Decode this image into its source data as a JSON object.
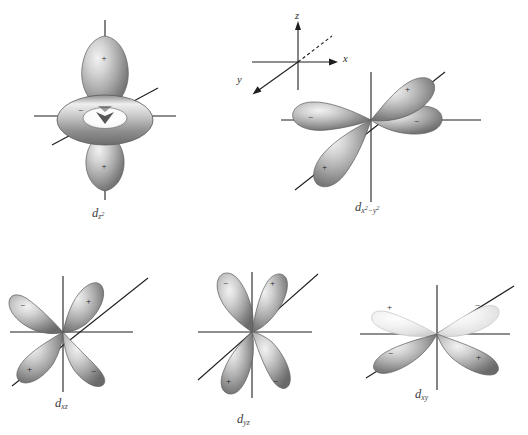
{
  "figure": {
    "background_color": "#ffffff",
    "axis_color": "#1f1f1f",
    "sign_color": "#1d1d1d",
    "lobe_fill_light": "#efefef",
    "lobe_fill_mid": "#b9b9b9",
    "lobe_fill_dark": "#6e6e6e",
    "lobe_outline": "#585858"
  },
  "axis_key": {
    "name": "coordinate-axes-key",
    "axes": [
      {
        "id": "z",
        "label": "z",
        "direction": "up",
        "style": "solid",
        "arrow": true
      },
      {
        "id": "x",
        "label": "x",
        "direction": "upper-right",
        "style": "dashed",
        "arrow": true
      },
      {
        "id": "y",
        "label": "y",
        "direction": "lower-left",
        "style": "solid",
        "arrow": true
      }
    ]
  },
  "orbitals": [
    {
      "id": "dz2",
      "label_d": "d",
      "label_sub": "z",
      "label_sup": "2",
      "caption_plain": "dz2",
      "shape": "two-lobes-plus-torus",
      "lobes": [
        {
          "position": "up",
          "sign": "+"
        },
        {
          "position": "torus",
          "sign": "−"
        },
        {
          "position": "down",
          "sign": "+"
        }
      ]
    },
    {
      "id": "dx2-y2",
      "label_d": "d",
      "label_sub_1": "x",
      "label_sup_1": "2",
      "label_minus": "−",
      "label_sub_2": "y",
      "label_sup_2": "2",
      "caption_plain": "dx2-y2",
      "shape": "four-lobes",
      "lobes": [
        {
          "position": "upper-right",
          "sign": "+"
        },
        {
          "position": "right",
          "sign": "−"
        },
        {
          "position": "left",
          "sign": "−"
        },
        {
          "position": "lower-left",
          "sign": "+"
        }
      ]
    },
    {
      "id": "dxz",
      "label_d": "d",
      "label_sub": "xz",
      "caption_plain": "dxz",
      "shape": "four-lobes",
      "lobes": [
        {
          "position": "upper-left",
          "sign": "−"
        },
        {
          "position": "upper-right",
          "sign": "+"
        },
        {
          "position": "lower-left",
          "sign": "+"
        },
        {
          "position": "lower-right",
          "sign": "−"
        }
      ]
    },
    {
      "id": "dyz",
      "label_d": "d",
      "label_sub": "yz",
      "caption_plain": "dyz",
      "shape": "four-lobes",
      "lobes": [
        {
          "position": "upper-left",
          "sign": "−"
        },
        {
          "position": "upper-right",
          "sign": "+"
        },
        {
          "position": "lower-left",
          "sign": "+"
        },
        {
          "position": "lower-right",
          "sign": "−"
        }
      ]
    },
    {
      "id": "dxy",
      "label_d": "d",
      "label_sub": "xy",
      "caption_plain": "dxy",
      "shape": "four-lobes",
      "lobes": [
        {
          "position": "upper-left",
          "sign": "+"
        },
        {
          "position": "upper-right",
          "sign": "−"
        },
        {
          "position": "lower-left",
          "sign": "−"
        },
        {
          "position": "lower-right",
          "sign": "+"
        }
      ]
    }
  ],
  "signs": {
    "plus": "+",
    "minus": "−"
  }
}
